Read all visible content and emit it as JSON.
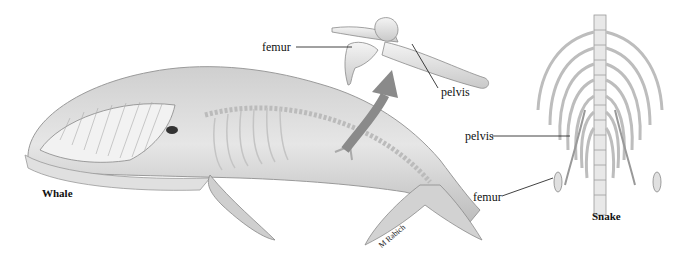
{
  "figure": {
    "whale": {
      "caption": "Whale",
      "labels": {
        "femur": "femur",
        "pelvis": "pelvis"
      },
      "signature": "M Rabich"
    },
    "snake": {
      "caption": "Snake",
      "labels": {
        "pelvis": "pelvis",
        "femur": "femur"
      }
    },
    "colors": {
      "bone": "#e8e8e8",
      "body": "#d6d6d6",
      "arrow": "#8a8a8a",
      "ink": "#111111"
    }
  }
}
